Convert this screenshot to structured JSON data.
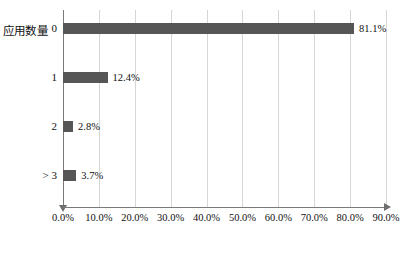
{
  "chart_data": {
    "type": "bar",
    "orientation": "horizontal",
    "title": "",
    "ylabel": "应用数量",
    "xlabel": "",
    "categories": [
      "0",
      "1",
      "2",
      "> 3"
    ],
    "values": [
      81.1,
      12.4,
      2.8,
      3.7
    ],
    "data_labels": [
      "81.1%",
      "12.4%",
      "2.8%",
      "3.7%"
    ],
    "xlim": [
      0,
      90
    ],
    "xticks": [
      0,
      10,
      20,
      30,
      40,
      50,
      60,
      70,
      80,
      90
    ],
    "xtick_labels": [
      "0.0%",
      "10.0%",
      "20.0%",
      "30.0%",
      "40.0%",
      "50.0%",
      "60.0%",
      "70.0%",
      "80.0%",
      "90.0%"
    ],
    "grid": "vertical",
    "legend": "none",
    "bar_color": "#565656",
    "gridline_color": "#d6d6d6",
    "axis_color": "#7a7a7a",
    "background": "#ffffff"
  }
}
